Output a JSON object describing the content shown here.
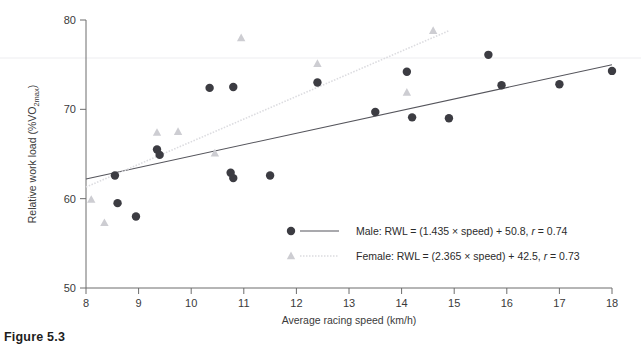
{
  "figure": {
    "caption": "Figure 5.3"
  },
  "chart_data": {
    "type": "scatter",
    "title": "",
    "xlabel": "Average racing speed (km/h)",
    "ylabel": "Relative work load (%VO2max)",
    "ylabel_main": "Relative work load (%VO",
    "ylabel_sub": "2max",
    "ylabel_tail": ")",
    "xlim": [
      8,
      18
    ],
    "ylim": [
      50,
      80
    ],
    "xticks": [
      8,
      9,
      10,
      11,
      12,
      13,
      14,
      15,
      16,
      17,
      18
    ],
    "yticks": [
      50,
      60,
      70,
      80
    ],
    "grid": false,
    "legend_position": "inside-bottom-center",
    "series": [
      {
        "name": "Male",
        "marker": "circle",
        "color": "#3c3c42",
        "line_style": "solid",
        "equation": "RWL = (1.435 × speed) + 50.8",
        "slope": 1.435,
        "intercept": 50.8,
        "r": 0.74,
        "legend_label": "Male: RWL = (1.435 × speed) + 50.8, r = 0.74",
        "points": [
          {
            "x": 8.55,
            "y": 62.6
          },
          {
            "x": 8.6,
            "y": 59.5
          },
          {
            "x": 8.95,
            "y": 58.0
          },
          {
            "x": 9.35,
            "y": 65.5
          },
          {
            "x": 9.4,
            "y": 64.9
          },
          {
            "x": 10.35,
            "y": 72.4
          },
          {
            "x": 10.8,
            "y": 72.5
          },
          {
            "x": 10.75,
            "y": 62.9
          },
          {
            "x": 10.8,
            "y": 62.3
          },
          {
            "x": 11.5,
            "y": 62.6
          },
          {
            "x": 12.4,
            "y": 73.0
          },
          {
            "x": 13.5,
            "y": 69.7
          },
          {
            "x": 14.1,
            "y": 74.2
          },
          {
            "x": 14.2,
            "y": 69.1
          },
          {
            "x": 14.9,
            "y": 69.0
          },
          {
            "x": 15.65,
            "y": 76.1
          },
          {
            "x": 15.9,
            "y": 72.7
          },
          {
            "x": 17.0,
            "y": 72.8
          },
          {
            "x": 18.0,
            "y": 74.3
          }
        ]
      },
      {
        "name": "Female",
        "marker": "triangle",
        "color": "#cdcdd2",
        "line_style": "dotted",
        "equation": "RWL = (2.365 × speed) + 42.5",
        "slope": 2.365,
        "intercept": 42.5,
        "r": 0.73,
        "legend_label": "Female: RWL = (2.365 × speed) + 42.5, r = 0.73",
        "points": [
          {
            "x": 8.1,
            "y": 59.9
          },
          {
            "x": 8.35,
            "y": 57.3
          },
          {
            "x": 9.35,
            "y": 67.4
          },
          {
            "x": 9.75,
            "y": 67.5
          },
          {
            "x": 10.45,
            "y": 65.1
          },
          {
            "x": 10.95,
            "y": 78.0
          },
          {
            "x": 12.4,
            "y": 75.1
          },
          {
            "x": 14.1,
            "y": 71.9
          },
          {
            "x": 14.6,
            "y": 78.8
          }
        ]
      }
    ],
    "fit_lines": [
      {
        "series": "Male",
        "x0": 8.0,
        "y0": 62.2,
        "x1": 18.0,
        "y1": 75.0,
        "style": "solid",
        "color": "#55555c"
      },
      {
        "series": "Female",
        "x0": 8.0,
        "y0": 61.3,
        "x1": 14.9,
        "y1": 78.8,
        "style": "dotted",
        "color": "#dcdce0"
      }
    ],
    "legend_entries": [
      {
        "marker": "circle",
        "line_style": "solid",
        "color": "#3c3c42",
        "label_prefix": "Male: RWL = (1.435 × speed) + 50.8, ",
        "label_r_var": "r",
        "label_r_value": " = 0.74"
      },
      {
        "marker": "triangle",
        "line_style": "dotted",
        "color": "#cdcdd2",
        "label_prefix": "Female: RWL = (2.365 × speed) + 42.5, ",
        "label_r_var": "r",
        "label_r_value": " = 0.73"
      }
    ]
  }
}
